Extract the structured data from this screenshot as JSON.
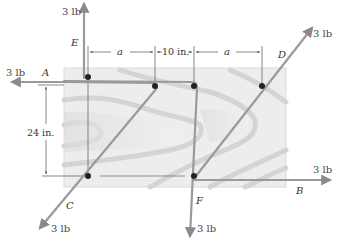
{
  "diagram": {
    "type": "statics-board-forces",
    "forces": [
      {
        "id": "A",
        "label": "A",
        "magnitude": "3 lb",
        "direction": "left"
      },
      {
        "id": "B",
        "label": "B",
        "magnitude": "3 lb",
        "direction": "right"
      },
      {
        "id": "C",
        "label": "C",
        "magnitude": "3 lb",
        "direction": "down-left"
      },
      {
        "id": "D",
        "label": "D",
        "magnitude": "3 lb",
        "direction": "up-right"
      },
      {
        "id": "E",
        "label": "E",
        "magnitude": "3 lb",
        "direction": "up"
      },
      {
        "id": "F",
        "label": "F",
        "magnitude": "3 lb",
        "direction": "down"
      }
    ],
    "dimensions": {
      "horizontal": [
        "a",
        "10 in.",
        "a"
      ],
      "vertical": "24 in."
    },
    "colors": {
      "board": "#ececec",
      "grain": "#d6d6d6",
      "cord": "#9a9a9a",
      "pin": "#222222",
      "dim_line": "#555555",
      "text": "#444444"
    }
  }
}
